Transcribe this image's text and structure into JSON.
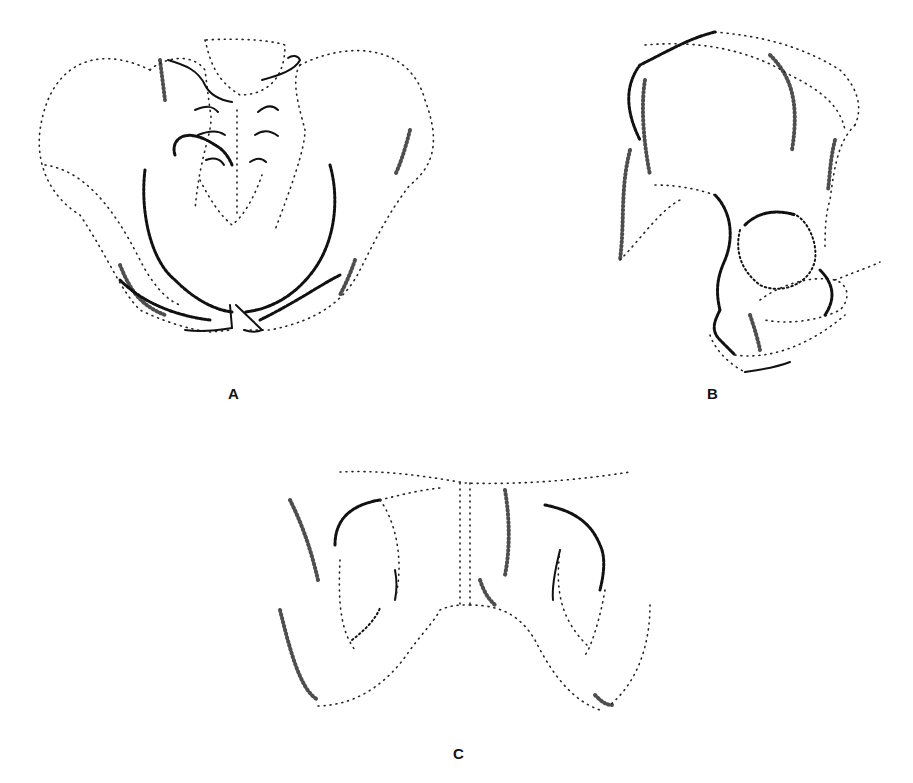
{
  "figure": {
    "panels": [
      {
        "id": "A",
        "label": "A",
        "view": "anterior view of pelvis"
      },
      {
        "id": "B",
        "label": "B",
        "view": "lateral view of hip bone"
      },
      {
        "id": "C",
        "label": "C",
        "view": "inferior/pubic arch view"
      }
    ],
    "colors": {
      "background": "#ffffff",
      "ink": "#111111"
    }
  }
}
